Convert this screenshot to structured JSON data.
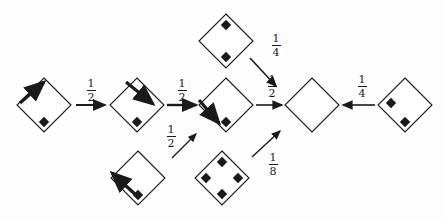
{
  "diagram": {
    "background_color": "#fdfdfd",
    "ink_color": "#1a1a1a",
    "nodes": [
      {
        "id": "node-a",
        "name": "diamond-node-a",
        "cx": 44,
        "cy": 105,
        "r": 27,
        "dots": [
          {
            "dx": 0,
            "dy": 17
          }
        ],
        "arrow": {
          "kind": "up-right",
          "x1": 20,
          "y1": 103,
          "x2": 44,
          "y2": 82
        }
      },
      {
        "id": "node-b",
        "name": "diamond-node-b",
        "cx": 137,
        "cy": 105,
        "r": 27,
        "dots": [
          {
            "dx": 0,
            "dy": 17
          }
        ],
        "arrow": {
          "kind": "down-right",
          "x1": 126,
          "y1": 82,
          "x2": 153,
          "y2": 104
        }
      },
      {
        "id": "node-top",
        "name": "diamond-node-top",
        "cx": 226,
        "cy": 41,
        "r": 27,
        "dots": [
          {
            "dx": 0,
            "dy": -16
          },
          {
            "dx": 0,
            "dy": 16
          }
        ],
        "arrow": null
      },
      {
        "id": "node-c",
        "name": "diamond-node-c",
        "cx": 226,
        "cy": 105,
        "r": 27,
        "dots": [
          {
            "dx": 0,
            "dy": 17
          }
        ],
        "arrow": {
          "kind": "down-right",
          "x1": 199,
          "y1": 100,
          "x2": 219,
          "y2": 123
        }
      },
      {
        "id": "node-bottom-left",
        "name": "diamond-node-bottom-left",
        "cx": 138,
        "cy": 178,
        "r": 27,
        "dots": [
          {
            "dx": 0,
            "dy": 17
          }
        ],
        "arrow": {
          "kind": "up-left",
          "x1": 137,
          "y1": 196,
          "x2": 112,
          "y2": 173
        }
      },
      {
        "id": "node-bottom-mid",
        "name": "diamond-node-bottom-mid",
        "cx": 222,
        "cy": 178,
        "r": 27,
        "dots": [
          {
            "dx": 0,
            "dy": -16
          },
          {
            "dx": -16,
            "dy": 0
          },
          {
            "dx": 16,
            "dy": 0
          },
          {
            "dx": 0,
            "dy": 16
          }
        ],
        "arrow": null
      },
      {
        "id": "node-empty",
        "name": "diamond-node-empty",
        "cx": 312,
        "cy": 105,
        "r": 27,
        "dots": [],
        "arrow": null
      },
      {
        "id": "node-right",
        "name": "diamond-node-right",
        "cx": 405,
        "cy": 105,
        "r": 27,
        "dots": [
          {
            "dx": -14,
            "dy": -2
          },
          {
            "dx": 0,
            "dy": 17
          }
        ],
        "arrow": null
      }
    ],
    "edges": [
      {
        "id": "edge-a-b",
        "name": "edge-a-to-b",
        "x1": 76,
        "y1": 105,
        "x2": 105,
        "y2": 105,
        "weight": 2
      },
      {
        "id": "edge-b-c",
        "name": "edge-b-to-c",
        "x1": 167,
        "y1": 105,
        "x2": 196,
        "y2": 105,
        "weight": 2.4
      },
      {
        "id": "edge-c-empty",
        "name": "edge-c-to-empty",
        "x1": 256,
        "y1": 105,
        "x2": 282,
        "y2": 105,
        "weight": 1.6
      },
      {
        "id": "edge-right-empty",
        "name": "edge-right-to-empty",
        "x1": 375,
        "y1": 105,
        "x2": 343,
        "y2": 105,
        "weight": 1.6
      },
      {
        "id": "edge-top-empty",
        "name": "edge-top-to-empty",
        "x1": 250,
        "y1": 58,
        "x2": 276,
        "y2": 86,
        "weight": 1.6
      },
      {
        "id": "edge-bl-c",
        "name": "edge-bottom-left-to-c",
        "x1": 172,
        "y1": 158,
        "x2": 196,
        "y2": 134,
        "weight": 1.3
      },
      {
        "id": "edge-bm-empty",
        "name": "edge-bottom-mid-to-empty",
        "x1": 252,
        "y1": 157,
        "x2": 280,
        "y2": 131,
        "weight": 1.4
      }
    ],
    "labels": [
      {
        "id": "label-1",
        "name": "edge-label-a-b",
        "numerator": "1",
        "denominator": "2",
        "x": 81,
        "y": 78
      },
      {
        "id": "label-2",
        "name": "edge-label-b-c",
        "numerator": "1",
        "denominator": "2",
        "x": 172,
        "y": 78
      },
      {
        "id": "label-3",
        "name": "edge-label-bottom-left-c",
        "numerator": "1",
        "denominator": "2",
        "x": 161,
        "y": 124
      },
      {
        "id": "label-4",
        "name": "edge-label-top-empty",
        "numerator": "1",
        "denominator": "4",
        "x": 266,
        "y": 33
      },
      {
        "id": "label-5",
        "name": "edge-label-c-empty",
        "numerator": "1",
        "denominator": "2",
        "x": 262,
        "y": 74
      },
      {
        "id": "label-6",
        "name": "edge-label-bottom-mid-empty",
        "numerator": "1",
        "denominator": "8",
        "x": 263,
        "y": 152
      },
      {
        "id": "label-7",
        "name": "edge-label-right-empty",
        "numerator": "1",
        "denominator": "4",
        "x": 352,
        "y": 74
      }
    ]
  }
}
